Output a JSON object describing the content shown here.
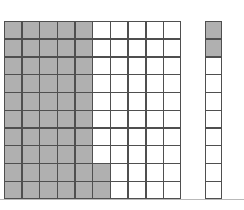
{
  "figure": {
    "background_color": "#ffffff",
    "separator_color": "#b9b9b9"
  },
  "style": {
    "shaded_color": "#b0b0b0",
    "unshaded_color": "#ffffff",
    "border_color": "#4f4f4f"
  },
  "chart_data": {
    "type": "heatmap",
    "xlabel": "",
    "ylabel": "",
    "grid": true,
    "legend": "none",
    "blocks": [
      {
        "name": "hundred-square",
        "rows": 10,
        "columns": 10,
        "total_cells": 100,
        "shaded_count": 52,
        "unshaded_count": 48,
        "shaded_fraction": "52/100",
        "cells": [
          [
            1,
            1,
            1,
            1,
            1,
            0,
            0,
            0,
            0,
            0
          ],
          [
            1,
            1,
            1,
            1,
            1,
            0,
            0,
            0,
            0,
            0
          ],
          [
            1,
            1,
            1,
            1,
            1,
            0,
            0,
            0,
            0,
            0
          ],
          [
            1,
            1,
            1,
            1,
            1,
            0,
            0,
            0,
            0,
            0
          ],
          [
            1,
            1,
            1,
            1,
            1,
            0,
            0,
            0,
            0,
            0
          ],
          [
            1,
            1,
            1,
            1,
            1,
            0,
            0,
            0,
            0,
            0
          ],
          [
            1,
            1,
            1,
            1,
            1,
            0,
            0,
            0,
            0,
            0
          ],
          [
            1,
            1,
            1,
            1,
            1,
            0,
            0,
            0,
            0,
            0
          ],
          [
            1,
            1,
            1,
            1,
            1,
            1,
            0,
            0,
            0,
            0
          ],
          [
            1,
            1,
            1,
            1,
            1,
            1,
            0,
            0,
            0,
            0
          ]
        ]
      },
      {
        "name": "tens-strip",
        "rows": 10,
        "columns": 1,
        "total_cells": 10,
        "shaded_count": 2,
        "unshaded_count": 8,
        "shaded_fraction": "2/10",
        "cells": [
          [
            1
          ],
          [
            1
          ],
          [
            0
          ],
          [
            0
          ],
          [
            0
          ],
          [
            0
          ],
          [
            0
          ],
          [
            0
          ],
          [
            0
          ],
          [
            0
          ]
        ]
      }
    ]
  }
}
